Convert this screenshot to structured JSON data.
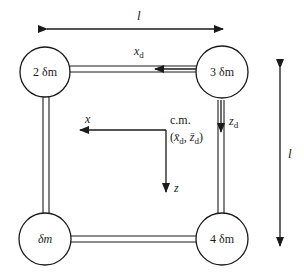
{
  "diagram": {
    "colors": {
      "ink": "#1a1a1a",
      "background": "#ffffff"
    },
    "dimensions": {
      "horizontal_label": "l",
      "vertical_label": "l"
    },
    "masses": [
      {
        "id": "mass-2",
        "label": "2 δm"
      },
      {
        "id": "mass-3",
        "label": "3 δm"
      },
      {
        "id": "mass-1",
        "label": "δm"
      },
      {
        "id": "mass-4",
        "label": "4 δm"
      }
    ],
    "axes": {
      "xd_label": "x",
      "xd_sub": "d",
      "zd_label": "z",
      "zd_sub": "d",
      "x_label": "x",
      "z_label": "z"
    },
    "center_of_mass": {
      "label": "c.m.",
      "coords_open": "(",
      "xbar": "x̄",
      "xbar_sub": "d",
      "sep": ", ",
      "zbar": "z̄",
      "zbar_sub": "d",
      "coords_close": ")"
    }
  }
}
